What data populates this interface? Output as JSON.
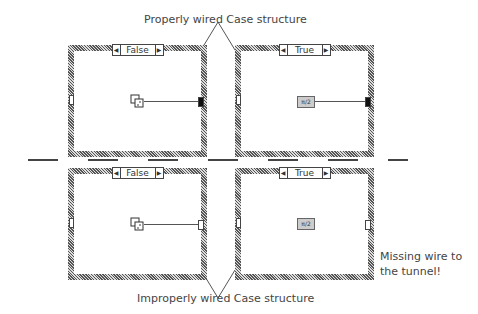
{
  "captions": {
    "top": "Properly wired Case structure",
    "bottom": "Improperly wired Case structure",
    "note_line1": "Missing wire to",
    "note_line2": "the tunnel!"
  },
  "panels": [
    {
      "case": "False",
      "icon": "random-number-dice",
      "wired": true
    },
    {
      "case": "True",
      "icon": "pi-over-2-constant",
      "icon_text": "π/2",
      "wired": true
    },
    {
      "case": "False",
      "icon": "random-number-dice",
      "wired": true
    },
    {
      "case": "True",
      "icon": "pi-over-2-constant",
      "icon_text": "π/2",
      "wired": false
    }
  ],
  "arrows": {
    "left": "◀",
    "right": "▶"
  }
}
